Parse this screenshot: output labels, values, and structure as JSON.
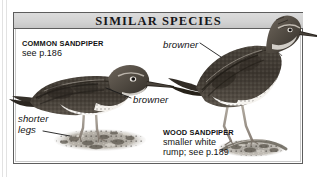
{
  "panel": {
    "header_title": "SIMILAR SPECIES"
  },
  "species": [
    {
      "id": "common-sandpiper",
      "name": "COMMON SANDPIPER",
      "page_ref": "see p.186",
      "annotations": [
        "browner",
        "shorter\nlegs"
      ]
    },
    {
      "id": "wood-sandpiper",
      "name": "WOOD SANDPIPER",
      "detail_line1": "smaller white",
      "detail_line2": "rump; see p.189",
      "annotations": [
        "browner"
      ]
    }
  ],
  "labels": {
    "common_name": "COMMON SANDPIPER",
    "common_page": "see p.186",
    "browner_left": "browner",
    "shorter_legs_line1": "shorter",
    "shorter_legs_line2": "legs",
    "browner_right": "browner",
    "wood_name": "WOOD SANDPIPER",
    "wood_detail_line1": "smaller white",
    "wood_detail_line2": "rump; see p.189"
  },
  "colors": {
    "frame": "#5d5d5d",
    "header_bg": "#d4d4d4",
    "text": "#121212",
    "page_bg": "#ffffff",
    "bird_dark": "#3a342e",
    "bird_mid": "#6b6159",
    "bird_light": "#cfc8bf",
    "ground": "#8c8880"
  }
}
